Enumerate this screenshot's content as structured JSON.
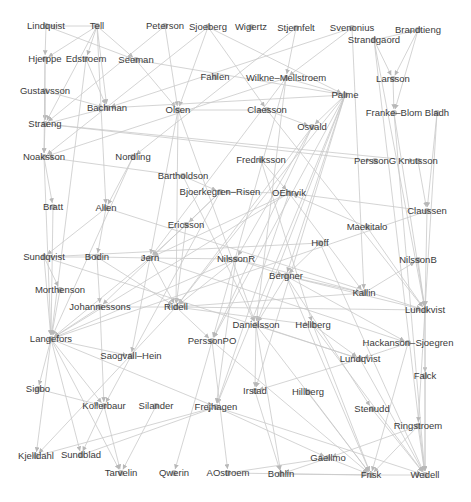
{
  "diagram": {
    "type": "directed-network-graph",
    "colors": {
      "edge": "#c9c9c9",
      "node": "#bdbdbd",
      "label": "#3a3a3a",
      "background": "#ffffff"
    },
    "nodes": [
      {
        "id": "Lindquist",
        "label": "Lindquist",
        "x": 46,
        "y": 26
      },
      {
        "id": "Tell",
        "label": "Tell",
        "x": 97,
        "y": 26
      },
      {
        "id": "Peterson",
        "label": "Peterson",
        "x": 165,
        "y": 26
      },
      {
        "id": "Sjoeberg",
        "label": "Sjoeberg",
        "x": 208,
        "y": 27
      },
      {
        "id": "Wigertz",
        "label": "Wigertz",
        "x": 251,
        "y": 27
      },
      {
        "id": "Stjernfelt",
        "label": "Stjernfelt",
        "x": 296,
        "y": 28
      },
      {
        "id": "Svenonius",
        "label": "Svenonius",
        "x": 352,
        "y": 28
      },
      {
        "id": "Brandtieng",
        "label": "Brandtieng",
        "x": 418,
        "y": 30
      },
      {
        "id": "Strandgaord",
        "label": "Strandgaord",
        "x": 374,
        "y": 40
      },
      {
        "id": "Hjerppe",
        "label": "Hjerppe",
        "x": 45,
        "y": 59
      },
      {
        "id": "Edstroem",
        "label": "Edstroem",
        "x": 86,
        "y": 59
      },
      {
        "id": "Seeman",
        "label": "Seeman",
        "x": 136,
        "y": 60
      },
      {
        "id": "Fahlen",
        "label": "Fahlen",
        "x": 215,
        "y": 77
      },
      {
        "id": "Wilkne-Mellstroem",
        "label": "Wilkne–Mellstroem",
        "x": 286,
        "y": 78
      },
      {
        "id": "Larsson",
        "label": "Larsson",
        "x": 393,
        "y": 79
      },
      {
        "id": "Gustavsson",
        "label": "Gustavsson",
        "x": 45,
        "y": 91
      },
      {
        "id": "Palme",
        "label": "Palme",
        "x": 345,
        "y": 95
      },
      {
        "id": "Bachman",
        "label": "Bachman",
        "x": 107,
        "y": 108
      },
      {
        "id": "Olsen",
        "label": "Olsen",
        "x": 178,
        "y": 110
      },
      {
        "id": "Claesson",
        "label": "Claesson",
        "x": 267,
        "y": 110
      },
      {
        "id": "Franke-Blom",
        "label": "Franke–Blom",
        "x": 394,
        "y": 113
      },
      {
        "id": "Bladh",
        "label": "Bladh",
        "x": 437,
        "y": 113
      },
      {
        "id": "Straeng",
        "label": "Straeng",
        "x": 45,
        "y": 124
      },
      {
        "id": "Osvald",
        "label": "Osvald",
        "x": 312,
        "y": 127
      },
      {
        "id": "Noaksson",
        "label": "Noaksson",
        "x": 44,
        "y": 157
      },
      {
        "id": "Nordling",
        "label": "Nordling",
        "x": 133,
        "y": 157
      },
      {
        "id": "Fredriksson",
        "label": "Fredriksson",
        "x": 261,
        "y": 160
      },
      {
        "id": "PerssonG",
        "label": "PerssonG",
        "x": 375,
        "y": 161
      },
      {
        "id": "Knutsson",
        "label": "Knutsson",
        "x": 418,
        "y": 161
      },
      {
        "id": "Bartholdson",
        "label": "Bartholdson",
        "x": 183,
        "y": 176
      },
      {
        "id": "Bjoerkegren-Risen",
        "label": "Bjoerkegren–Risen",
        "x": 220,
        "y": 192
      },
      {
        "id": "OEhrvik",
        "label": "OEhrvik",
        "x": 289,
        "y": 193
      },
      {
        "id": "Bratt",
        "label": "Bratt",
        "x": 53,
        "y": 207
      },
      {
        "id": "Allen",
        "label": "Allen",
        "x": 106,
        "y": 208
      },
      {
        "id": "Claussen",
        "label": "Claussen",
        "x": 427,
        "y": 211
      },
      {
        "id": "Ericsson",
        "label": "Ericsson",
        "x": 186,
        "y": 225
      },
      {
        "id": "Maekitalo",
        "label": "Maekitalo",
        "x": 367,
        "y": 227
      },
      {
        "id": "Hoff",
        "label": "Hoff",
        "x": 320,
        "y": 243
      },
      {
        "id": "Sundqvist",
        "label": "Sundqvist",
        "x": 44,
        "y": 257
      },
      {
        "id": "Bodin",
        "label": "Bodin",
        "x": 97,
        "y": 257
      },
      {
        "id": "Jern",
        "label": "Jern",
        "x": 150,
        "y": 258
      },
      {
        "id": "NilssonR",
        "label": "NilssonR",
        "x": 236,
        "y": 259
      },
      {
        "id": "NilssonB",
        "label": "NilssonB",
        "x": 418,
        "y": 260
      },
      {
        "id": "Bergner",
        "label": "Bergner",
        "x": 286,
        "y": 276
      },
      {
        "id": "Morthenson",
        "label": "Morthenson",
        "x": 60,
        "y": 290
      },
      {
        "id": "Kallin",
        "label": "Kallin",
        "x": 364,
        "y": 293
      },
      {
        "id": "Lundkvist",
        "label": "Lundkvist",
        "x": 425,
        "y": 310
      },
      {
        "id": "Johannessons",
        "label": "Johannessons",
        "x": 100,
        "y": 307
      },
      {
        "id": "Ridell",
        "label": "Ridell",
        "x": 176,
        "y": 307
      },
      {
        "id": "Danielsson",
        "label": "Danielsson",
        "x": 256,
        "y": 325
      },
      {
        "id": "Hellberg",
        "label": "Hellberg",
        "x": 313,
        "y": 325
      },
      {
        "id": "Langefors",
        "label": "Langefors",
        "x": 51,
        "y": 339
      },
      {
        "id": "PerssonPO",
        "label": "PerssonPO",
        "x": 212,
        "y": 341
      },
      {
        "id": "Hackanson-Sjoegren",
        "label": "Hackanson–Sjoegren",
        "x": 408,
        "y": 343
      },
      {
        "id": "Saogvall-Hein",
        "label": "Saogvall–Hein",
        "x": 131,
        "y": 356
      },
      {
        "id": "Lundqvist",
        "label": "Lundqvist",
        "x": 360,
        "y": 359
      },
      {
        "id": "Falck",
        "label": "Falck",
        "x": 425,
        "y": 376
      },
      {
        "id": "Sigbo",
        "label": "Sigbo",
        "x": 38,
        "y": 389
      },
      {
        "id": "Irstad",
        "label": "Irstad",
        "x": 255,
        "y": 391
      },
      {
        "id": "Hillberg",
        "label": "Hillberg",
        "x": 308,
        "y": 392
      },
      {
        "id": "Kollerbaur",
        "label": "Kollerbaur",
        "x": 104,
        "y": 406
      },
      {
        "id": "Silander",
        "label": "Silander",
        "x": 156,
        "y": 406
      },
      {
        "id": "Frejhagen",
        "label": "Frejhagen",
        "x": 216,
        "y": 407
      },
      {
        "id": "Stenudd",
        "label": "Stenudd",
        "x": 372,
        "y": 409
      },
      {
        "id": "Ringstroem",
        "label": "Ringstroem",
        "x": 418,
        "y": 426
      },
      {
        "id": "Kjelldahl",
        "label": "Kjelldahl",
        "x": 36,
        "y": 456
      },
      {
        "id": "Sundblad",
        "label": "Sundblad",
        "x": 81,
        "y": 455
      },
      {
        "id": "Gaellmo",
        "label": "Gaellmo",
        "x": 328,
        "y": 458
      },
      {
        "id": "Tarvelin",
        "label": "Tarvelin",
        "x": 121,
        "y": 473
      },
      {
        "id": "Qwerin",
        "label": "Qwerin",
        "x": 174,
        "y": 473
      },
      {
        "id": "AOstroem",
        "label": "AOstroem",
        "x": 228,
        "y": 473
      },
      {
        "id": "Bohlin",
        "label": "Bohlin",
        "x": 281,
        "y": 474
      },
      {
        "id": "Frisk",
        "label": "Frisk",
        "x": 371,
        "y": 475
      },
      {
        "id": "Wedell",
        "label": "Wedell",
        "x": 425,
        "y": 475
      }
    ],
    "edges": [
      [
        "Tell",
        "Lindquist"
      ],
      [
        "Lindquist",
        "Hjerppe"
      ],
      [
        "Tell",
        "Hjerppe"
      ],
      [
        "Tell",
        "Edstroem"
      ],
      [
        "Tell",
        "Straeng"
      ],
      [
        "Tell",
        "Bachman"
      ],
      [
        "Tell",
        "Allen"
      ],
      [
        "Tell",
        "Seeman"
      ],
      [
        "Lindquist",
        "Seeman"
      ],
      [
        "Hjerppe",
        "Straeng"
      ],
      [
        "Gustavsson",
        "Straeng"
      ],
      [
        "Hjerppe",
        "Noaksson"
      ],
      [
        "Straeng",
        "Noaksson"
      ],
      [
        "Noaksson",
        "Bratt"
      ],
      [
        "Straeng",
        "PerssonG"
      ],
      [
        "Straeng",
        "Knutsson"
      ],
      [
        "Straeng",
        "Bachman"
      ],
      [
        "Edstroem",
        "Langefors"
      ],
      [
        "Edstroem",
        "Bachman"
      ],
      [
        "Peterson",
        "Straeng"
      ],
      [
        "Sjoeberg",
        "Olsen"
      ],
      [
        "Sjoeberg",
        "Palme"
      ],
      [
        "Sjoeberg",
        "Noaksson"
      ],
      [
        "Sjoeberg",
        "Claesson"
      ],
      [
        "Peterson",
        "Olsen"
      ],
      [
        "Seeman",
        "Olsen"
      ],
      [
        "Seeman",
        "Palme"
      ],
      [
        "Olsen",
        "Ridell"
      ],
      [
        "Olsen",
        "Danielsson"
      ],
      [
        "Olsen",
        "Jern"
      ],
      [
        "Olsen",
        "Claesson"
      ],
      [
        "Stjernfelt",
        "Wilkne-Mellstroem"
      ],
      [
        "Svenonius",
        "Wilkne-Mellstroem"
      ],
      [
        "Svenonius",
        "Kallin"
      ],
      [
        "Svenonius",
        "Bachman"
      ],
      [
        "Stjernfelt",
        "Nordling"
      ],
      [
        "Strandgaord",
        "Brandtieng"
      ],
      [
        "Strandgaord",
        "Larsson"
      ],
      [
        "Brandtieng",
        "Larsson"
      ],
      [
        "Strandgaord",
        "Lundkvist"
      ],
      [
        "Strandgaord",
        "Wedell"
      ],
      [
        "Brandtieng",
        "Franke-Blom"
      ],
      [
        "Larsson",
        "Franke-Blom"
      ],
      [
        "Franke-Blom",
        "Lundkvist"
      ],
      [
        "Franke-Blom",
        "Wedell"
      ],
      [
        "Bladh",
        "Claussen"
      ],
      [
        "Bladh",
        "Lundkvist"
      ],
      [
        "Knutsson",
        "Claussen"
      ],
      [
        "Claussen",
        "Lundkvist"
      ],
      [
        "NilssonB",
        "Lundkvist"
      ],
      [
        "Claussen",
        "OEhrvik"
      ],
      [
        "Claussen",
        "Langefors"
      ],
      [
        "Wilkne-Mellstroem",
        "Palme"
      ],
      [
        "Wilkne-Mellstroem",
        "Noaksson"
      ],
      [
        "Wilkne-Mellstroem",
        "Jern"
      ],
      [
        "Wilkne-Mellstroem",
        "PerssonPO"
      ],
      [
        "Wilkne-Mellstroem",
        "Danielsson"
      ],
      [
        "Palme",
        "Osvald"
      ],
      [
        "Palme",
        "Bachman"
      ],
      [
        "Palme",
        "Irstad"
      ],
      [
        "Palme",
        "Danielsson"
      ],
      [
        "Palme",
        "Frejhagen"
      ],
      [
        "Palme",
        "PerssonPO"
      ],
      [
        "Palme",
        "Ridell"
      ],
      [
        "Palme",
        "Bergner"
      ],
      [
        "Claesson",
        "Osvald"
      ],
      [
        "Claesson",
        "Lundkvist"
      ],
      [
        "Osvald",
        "Ridell"
      ],
      [
        "Osvald",
        "NilssonR"
      ],
      [
        "Osvald",
        "PerssonPO"
      ],
      [
        "Fredriksson",
        "OEhrvik"
      ],
      [
        "Fredriksson",
        "Hellberg"
      ],
      [
        "OEhrvik",
        "Bjoerkegren-Risen"
      ],
      [
        "OEhrvik",
        "Jern"
      ],
      [
        "OEhrvik",
        "Kallin"
      ],
      [
        "OEhrvik",
        "Langefors"
      ],
      [
        "OEhrvik",
        "Frejhagen"
      ],
      [
        "Bartholdson",
        "Bjoerkegren-Risen"
      ],
      [
        "Bartholdson",
        "Noaksson"
      ],
      [
        "Bartholdson",
        "Danielsson"
      ],
      [
        "Bjoerkegren-Risen",
        "Ericsson"
      ],
      [
        "Bjoerkegren-Risen",
        "Johannessons"
      ],
      [
        "Bjoerkegren-Risen",
        "Kollerbaur"
      ],
      [
        "Nordling",
        "Allen"
      ],
      [
        "Nordling",
        "Langefors"
      ],
      [
        "Allen",
        "Bodin"
      ],
      [
        "Allen",
        "Lundkvist"
      ],
      [
        "Allen",
        "Sundqvist"
      ],
      [
        "Ericsson",
        "Jern"
      ],
      [
        "Ericsson",
        "Ridell"
      ],
      [
        "Maekitalo",
        "Lundkvist"
      ],
      [
        "Maekitalo",
        "OEhrvik"
      ],
      [
        "Hoff",
        "Sundqvist"
      ],
      [
        "Hoff",
        "Bergner"
      ],
      [
        "Hoff",
        "Wedell"
      ],
      [
        "Sundqvist",
        "Bodin"
      ],
      [
        "Sundqvist",
        "Morthenson"
      ],
      [
        "Sundqvist",
        "Langefors"
      ],
      [
        "Sundqvist",
        "Lundqvist"
      ],
      [
        "Bodin",
        "Jern"
      ],
      [
        "Bodin",
        "Johannessons"
      ],
      [
        "Bodin",
        "Ridell"
      ],
      [
        "Jern",
        "NilssonR"
      ],
      [
        "Jern",
        "Langefors"
      ],
      [
        "Jern",
        "Ridell"
      ],
      [
        "Jern",
        "Saogvall-Hein"
      ],
      [
        "Jern",
        "Hackanson-Sjoegren"
      ],
      [
        "NilssonR",
        "Bergner"
      ],
      [
        "NilssonR",
        "Ridell"
      ],
      [
        "NilssonR",
        "Kallin"
      ],
      [
        "NilssonR",
        "Langefors"
      ],
      [
        "NilssonR",
        "Frejhagen"
      ],
      [
        "Bergner",
        "Kallin"
      ],
      [
        "Bergner",
        "Danielsson"
      ],
      [
        "Bergner",
        "Hackanson-Sjoegren"
      ],
      [
        "Bergner",
        "Frisk"
      ],
      [
        "Bergner",
        "Lundkvist"
      ],
      [
        "Bergner",
        "Stenudd"
      ],
      [
        "Kallin",
        "NilssonB"
      ],
      [
        "Kallin",
        "Ridell"
      ],
      [
        "Morthenson",
        "Langefors"
      ],
      [
        "Johannessons",
        "Ridell"
      ],
      [
        "Johannessons",
        "Langefors"
      ],
      [
        "Johannessons",
        "Kollerbaur"
      ],
      [
        "Ridell",
        "PerssonPO"
      ],
      [
        "Ridell",
        "Lundkvist"
      ],
      [
        "Ridell",
        "Kjelldahl"
      ],
      [
        "Ridell",
        "Hellberg"
      ],
      [
        "Danielsson",
        "Bohlin"
      ],
      [
        "Danielsson",
        "Lundqvist"
      ],
      [
        "Danielsson",
        "Frisk"
      ],
      [
        "Danielsson",
        "Irstad"
      ],
      [
        "Hellberg",
        "Lundqvist"
      ],
      [
        "Hellberg",
        "Frisk"
      ],
      [
        "Hellberg",
        "Wedell"
      ],
      [
        "Langefors",
        "Kollerbaur"
      ],
      [
        "Langefors",
        "Kjelldahl"
      ],
      [
        "Langefors",
        "Sundblad"
      ],
      [
        "Langefors",
        "Tarvelin"
      ],
      [
        "Langefors",
        "Frejhagen"
      ],
      [
        "Langefors",
        "Sigbo"
      ],
      [
        "Langefors",
        "Saogvall-Hein"
      ],
      [
        "PerssonPO",
        "Qwerin"
      ],
      [
        "PerssonPO",
        "AOstroem"
      ],
      [
        "PerssonPO",
        "Frisk"
      ],
      [
        "Hackanson-Sjoegren",
        "Lundqvist"
      ],
      [
        "Hackanson-Sjoegren",
        "Frisk"
      ],
      [
        "Lundqvist",
        "Irstad"
      ],
      [
        "Lundqvist",
        "Wedell"
      ],
      [
        "Lundkvist",
        "Falck"
      ],
      [
        "Lundkvist",
        "Wedell"
      ],
      [
        "Lundkvist",
        "Ringstroem"
      ],
      [
        "Falck",
        "Wedell"
      ],
      [
        "Sigbo",
        "Kollerbaur"
      ],
      [
        "Kollerbaur",
        "Sundblad"
      ],
      [
        "Kollerbaur",
        "Tarvelin"
      ],
      [
        "Silander",
        "Tarvelin"
      ],
      [
        "Frejhagen",
        "Wedell"
      ],
      [
        "Frejhagen",
        "Gaellmo"
      ],
      [
        "Irstad",
        "Bohlin"
      ],
      [
        "Hillberg",
        "Frisk"
      ],
      [
        "Stenudd",
        "Wedell"
      ],
      [
        "Ringstroem",
        "Frisk"
      ],
      [
        "Ringstroem",
        "Wedell"
      ],
      [
        "Ringstroem",
        "Gaellmo"
      ],
      [
        "Gaellmo",
        "Frisk"
      ],
      [
        "Gaellmo",
        "Bohlin"
      ],
      [
        "AOstroem",
        "Frisk"
      ],
      [
        "Bohlin",
        "Frisk"
      ],
      [
        "Frisk",
        "Wedell"
      ],
      [
        "AOstroem",
        "Gaellmo"
      ],
      [
        "Kjelldahl",
        "Frejhagen"
      ],
      [
        "Sundblad",
        "Frejhagen"
      ],
      [
        "Bratt",
        "Langefors"
      ],
      [
        "Noaksson",
        "Langefors"
      ],
      [
        "Gustavsson",
        "Bachman"
      ]
    ]
  }
}
